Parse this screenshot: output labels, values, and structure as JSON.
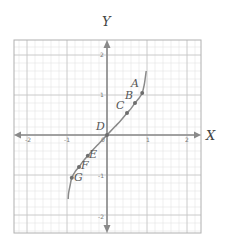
{
  "figure": {
    "x_axis_label": "X",
    "y_axis_label": "Y",
    "x_ticks": [
      "-2",
      "-1",
      "0",
      "1",
      "2"
    ],
    "y_ticks": [
      "2",
      "1",
      "-1",
      "-2"
    ],
    "colors": {
      "axis": "#8a8a8a",
      "curve": "#8a8a8a",
      "point": "#6e6e6e",
      "major_grid": "#c4c4c4",
      "minor_grid": "#e4e4e4",
      "frame": "#b0b0b0"
    }
  },
  "chart_data": {
    "type": "line",
    "title": "",
    "xlabel": "X",
    "ylabel": "Y",
    "xlim": [
      -2.3,
      2.3
    ],
    "ylim": [
      -2.45,
      2.35
    ],
    "grid": true,
    "grid_minor_per_unit": 5,
    "curve": {
      "description": "increasing S-shaped curve through origin, steep near ends",
      "x": [
        -0.97,
        -0.96,
        -0.92,
        -0.88,
        -0.8,
        -0.7,
        -0.6,
        -0.48,
        -0.35,
        -0.2,
        0,
        0.2,
        0.35,
        0.5,
        0.6,
        0.7,
        0.8,
        0.88,
        0.93,
        0.96,
        0.98
      ],
      "y": [
        -1.6,
        -1.45,
        -1.25,
        -1.07,
        -0.92,
        -0.8,
        -0.66,
        -0.52,
        -0.37,
        -0.21,
        0,
        0.21,
        0.37,
        0.55,
        0.66,
        0.8,
        0.92,
        1.05,
        1.25,
        1.45,
        1.6
      ]
    },
    "points": [
      {
        "label": "A",
        "x": 0.88,
        "y": 1.05
      },
      {
        "label": "B",
        "x": 0.7,
        "y": 0.8
      },
      {
        "label": "C",
        "x": 0.5,
        "y": 0.55
      },
      {
        "label": "D",
        "x": 0,
        "y": 0
      },
      {
        "label": "E",
        "x": -0.48,
        "y": -0.52
      },
      {
        "label": "F",
        "x": -0.7,
        "y": -0.8
      },
      {
        "label": "G",
        "x": -0.88,
        "y": -1.07
      }
    ]
  }
}
